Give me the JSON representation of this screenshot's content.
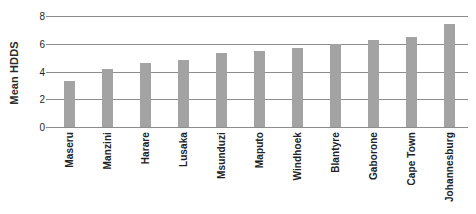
{
  "chart_data": {
    "type": "bar",
    "title": "",
    "xlabel": "",
    "ylabel": "Mean HDDS",
    "ylim": [
      0,
      8
    ],
    "yticks": [
      0,
      2,
      4,
      6,
      8
    ],
    "grid": true,
    "legend": "none",
    "bar_color": "#a3a3a3",
    "categories": [
      "Maseru",
      "Manzini",
      "Harare",
      "Lusaka",
      "Msunduzi",
      "Maputo",
      "Windhoek",
      "Blantyre",
      "Gaborone",
      "Cape Town",
      "Johannesburg"
    ],
    "values": [
      3.3,
      4.2,
      4.6,
      4.8,
      5.3,
      5.5,
      5.7,
      6.0,
      6.3,
      6.5,
      7.4
    ]
  },
  "axes": {
    "y_title": "Mean HDDS",
    "y_tick_labels": [
      "8",
      "6",
      "4",
      "2",
      "0"
    ]
  },
  "header": {
    "title_remnant": ""
  }
}
